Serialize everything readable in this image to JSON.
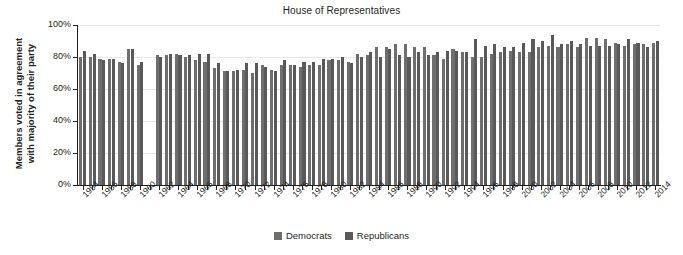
{
  "chart_data": {
    "type": "bar",
    "title": "House of Representatives",
    "xlabel": "",
    "ylabel": "Members voted in agreement with majority of their party",
    "ylabel_line1": "Members voted in agreement",
    "ylabel_line2": "with majority of their party",
    "ylim": [
      0,
      100
    ],
    "ytick_labels": [
      "0%",
      "20%",
      "40%",
      "60%",
      "80%",
      "100%"
    ],
    "ytick_values": [
      0,
      20,
      40,
      60,
      80,
      100
    ],
    "grid": true,
    "legend_position": "bottom-center",
    "xlim": [
      1953,
      2015
    ],
    "x_tick_step": 1,
    "x_label_step": 2,
    "categories": [
      1954,
      1955,
      1956,
      1957,
      1958,
      1959,
      1960,
      1961,
      1962,
      1963,
      1964,
      1965,
      1966,
      1967,
      1968,
      1969,
      1970,
      1971,
      1972,
      1973,
      1974,
      1975,
      1976,
      1977,
      1978,
      1979,
      1980,
      1981,
      1982,
      1983,
      1984,
      1985,
      1986,
      1987,
      1988,
      1989,
      1990,
      1991,
      1992,
      1993,
      1994,
      1995,
      1996,
      1997,
      1998,
      1999,
      2000,
      2001,
      2002,
      2003,
      2004,
      2005,
      2006,
      2007,
      2008,
      2009,
      2010,
      2011,
      2012,
      2013,
      2014
    ],
    "tick_labels": [
      "1954",
      "1956",
      "1958",
      "1960",
      "1962",
      "1964",
      "1966",
      "1968",
      "1970",
      "1972",
      "1974",
      "1976",
      "1978",
      "1980",
      "1982",
      "1984",
      "1986",
      "1988",
      "1990",
      "1992",
      "1994",
      "1996",
      "1998",
      "2000",
      "2002",
      "2004",
      "2006",
      "2008",
      "2010",
      "2012",
      "2014"
    ],
    "series": [
      {
        "name": "Democrats",
        "color": "#6e6e6e",
        "values": [
          80,
          80,
          79,
          79,
          77,
          85,
          75,
          null,
          81,
          81,
          82,
          80,
          78,
          77,
          73,
          71,
          71,
          72,
          70,
          75,
          72,
          75,
          75,
          74,
          75,
          75,
          78,
          78,
          77,
          82,
          81,
          86,
          86,
          88,
          88,
          86,
          86,
          81,
          79,
          85,
          83,
          80,
          80,
          82,
          83,
          84,
          83,
          83,
          86,
          87,
          86,
          88,
          86,
          92,
          92,
          91,
          89,
          87,
          88,
          88,
          89
        ],
        "null_years": [
          1961
        ]
      },
      {
        "name": "Republicans",
        "color": "#595959",
        "values": [
          84,
          82,
          78,
          79,
          76,
          85,
          77,
          null,
          80,
          82,
          81,
          81,
          82,
          82,
          76,
          71,
          72,
          76,
          76,
          74,
          71,
          78,
          75,
          77,
          77,
          79,
          79,
          80,
          76,
          80,
          83,
          80,
          85,
          81,
          80,
          83,
          81,
          83,
          84,
          84,
          83,
          91,
          87,
          88,
          86,
          86,
          89,
          91,
          90,
          94,
          88,
          90,
          88,
          87,
          87,
          87,
          88,
          91,
          89,
          86,
          90
        ],
        "null_years": [
          1961
        ]
      }
    ]
  },
  "legend": {
    "items": [
      {
        "label": "Democrats",
        "color": "#6e6e6e"
      },
      {
        "label": "Republicans",
        "color": "#595959"
      }
    ]
  },
  "colors": {
    "democrat": "#6e6e6e",
    "republican": "#595959",
    "axis": "#231f20",
    "grid": "#e8e8e8",
    "background": "#ffffff"
  }
}
